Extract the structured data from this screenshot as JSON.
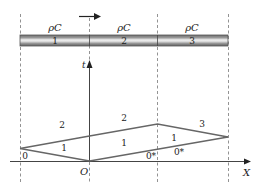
{
  "diagram": {
    "rod": {
      "segments": [
        {
          "label": "1",
          "material": "ρC"
        },
        {
          "label": "2",
          "material": "ρC"
        },
        {
          "label": "3",
          "material": "ρC"
        }
      ],
      "direction_arrow": "right-arrow"
    },
    "axes": {
      "vertical_label": "t",
      "horizontal_label": "X",
      "origin_label": "O"
    },
    "regions": {
      "upper_left": "2",
      "upper_middle": "2",
      "upper_right": "3",
      "inner_left": "1",
      "inner_middle": "1",
      "inner_right": "1",
      "bottom_left": "0",
      "bottom_middle": "0*",
      "bottom_right": "0*"
    },
    "colors": {
      "line": "#555555",
      "rod_dark": "#7a7a7a",
      "rod_light": "#e8e8e8"
    }
  }
}
